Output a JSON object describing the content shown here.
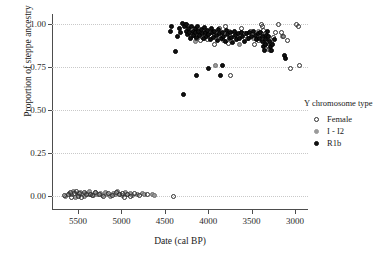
{
  "chart_data": {
    "type": "scatter",
    "title": "",
    "xlabel": "Date (cal BP)",
    "ylabel": "Proportion of steppe ancestry",
    "xlim": [
      5800,
      2850
    ],
    "ylim": [
      -0.08,
      1.06
    ],
    "x_reversed": true,
    "xticks": [
      5500,
      5000,
      4500,
      4000,
      3500,
      3000
    ],
    "yticks": [
      0.0,
      0.25,
      0.5,
      0.75,
      1.0
    ],
    "ytick_labels": [
      "0.00",
      "0.25",
      "0.50",
      "0.75",
      "1.00"
    ],
    "xtick_labels": [
      "5500",
      "5000",
      "4500",
      "4000",
      "3500",
      "3000"
    ],
    "grid": "horizontal-dotted",
    "legend": {
      "title": "Y chromosome type",
      "position": "right",
      "entries": [
        {
          "name": "Female",
          "marker": "open-circle",
          "color": "#2e2e2e",
          "fill": "none"
        },
        {
          "name": "I - I2",
          "marker": "filled-circle",
          "color": "#9a9a9a",
          "fill": "#9a9a9a"
        },
        {
          "name": "R1b",
          "marker": "filled-circle",
          "color": "#111111",
          "fill": "#111111"
        }
      ]
    },
    "series": [
      {
        "name": "Female",
        "points": [
          [
            5660,
            0.005
          ],
          [
            5610,
            0.01
          ],
          [
            5585,
            0.02
          ],
          [
            5570,
            -0.005
          ],
          [
            5545,
            0.015
          ],
          [
            5520,
            0.025
          ],
          [
            5500,
            0.0
          ],
          [
            5478,
            0.018
          ],
          [
            5455,
            -0.01
          ],
          [
            5430,
            0.022
          ],
          [
            5400,
            0.008
          ],
          [
            5360,
            0.012
          ],
          [
            5330,
            0.002
          ],
          [
            5300,
            0.02
          ],
          [
            5255,
            0.01
          ],
          [
            5210,
            0.0
          ],
          [
            5150,
            0.015
          ],
          [
            5105,
            0.005
          ],
          [
            5060,
            0.022
          ],
          [
            5020,
            0.008
          ],
          [
            4990,
            0.018
          ],
          [
            4960,
            -0.005
          ],
          [
            4930,
            0.012
          ],
          [
            4900,
            0.0
          ],
          [
            4850,
            0.015
          ],
          [
            4790,
            0.005
          ],
          [
            4700,
            0.01
          ],
          [
            4400,
            0.0
          ],
          [
            4260,
            1.0
          ],
          [
            4230,
            0.985
          ],
          [
            4215,
            0.955
          ],
          [
            4195,
            0.93
          ],
          [
            4180,
            0.975
          ],
          [
            4160,
            0.945
          ],
          [
            4140,
            0.92
          ],
          [
            4120,
            0.96
          ],
          [
            4105,
            0.935
          ],
          [
            4085,
            0.905
          ],
          [
            4060,
            0.965
          ],
          [
            4035,
            0.94
          ],
          [
            4010,
            0.91
          ],
          [
            3985,
            0.955
          ],
          [
            3960,
            0.93
          ],
          [
            3930,
            0.88
          ],
          [
            3900,
            0.945
          ],
          [
            3870,
            0.975
          ],
          [
            3840,
            0.915
          ],
          [
            3800,
            0.985
          ],
          [
            3770,
            0.89
          ],
          [
            3740,
            0.7
          ],
          [
            3700,
            0.955
          ],
          [
            3660,
            0.925
          ],
          [
            3620,
            0.975
          ],
          [
            3580,
            0.945
          ],
          [
            3545,
            0.915
          ],
          [
            3510,
            0.96
          ],
          [
            3470,
            0.88
          ],
          [
            3440,
            0.935
          ],
          [
            3415,
            0.905
          ],
          [
            3390,
            1.0
          ],
          [
            3375,
            0.985
          ],
          [
            3360,
            0.965
          ],
          [
            3345,
            0.945
          ],
          [
            3330,
            0.925
          ],
          [
            3315,
            0.9
          ],
          [
            3300,
            0.87
          ],
          [
            3285,
            0.845
          ],
          [
            3270,
            0.89
          ],
          [
            3250,
            0.925
          ],
          [
            3230,
            0.955
          ],
          [
            3190,
            1.0
          ],
          [
            3160,
            0.955
          ],
          [
            3130,
            0.93
          ],
          [
            3090,
            0.905
          ],
          [
            3050,
            0.745
          ],
          [
            2980,
            1.0
          ],
          [
            2960,
            0.985
          ],
          [
            2950,
            0.76
          ]
        ]
      },
      {
        "name": "I - I2",
        "points": [
          [
            5640,
            0.0
          ],
          [
            5600,
            0.018
          ],
          [
            5575,
            0.008
          ],
          [
            5550,
            0.025
          ],
          [
            5530,
            -0.008
          ],
          [
            5510,
            0.015
          ],
          [
            5490,
            0.005
          ],
          [
            5470,
            0.022
          ],
          [
            5450,
            0.01
          ],
          [
            5425,
            0.0
          ],
          [
            5410,
            0.018
          ],
          [
            5385,
            0.008
          ],
          [
            5365,
            0.025
          ],
          [
            5340,
            0.012
          ],
          [
            5320,
            0.002
          ],
          [
            5295,
            0.02
          ],
          [
            5270,
            0.008
          ],
          [
            5240,
            0.015
          ],
          [
            5215,
            0.005
          ],
          [
            5185,
            0.022
          ],
          [
            5160,
            0.01
          ],
          [
            5130,
            0.0
          ],
          [
            5095,
            0.018
          ],
          [
            5070,
            0.008
          ],
          [
            5040,
            0.025
          ],
          [
            5010,
            0.012
          ],
          [
            4985,
            0.002
          ],
          [
            4955,
            0.02
          ],
          [
            4925,
            0.008
          ],
          [
            4895,
            0.015
          ],
          [
            4870,
            0.005
          ],
          [
            4820,
            0.01
          ],
          [
            4760,
            0.018
          ],
          [
            4730,
            0.008
          ],
          [
            4640,
            0.012
          ],
          [
            4620,
            0.005
          ],
          [
            4240,
            0.96
          ],
          [
            4190,
            0.93
          ],
          [
            4150,
            0.9
          ],
          [
            4100,
            0.945
          ],
          [
            4040,
            0.915
          ],
          [
            3975,
            0.955
          ],
          [
            3920,
            0.76
          ],
          [
            3880,
            0.935
          ],
          [
            3820,
            0.905
          ],
          [
            3760,
            0.96
          ],
          [
            3700,
            0.93
          ],
          [
            3640,
            0.88
          ],
          [
            3560,
            0.945
          ],
          [
            3480,
            0.915
          ],
          [
            3420,
            0.96
          ],
          [
            3355,
            0.935
          ],
          [
            3335,
            0.885
          ],
          [
            3310,
            0.855
          ],
          [
            3290,
            0.905
          ],
          [
            3140,
            0.93
          ]
        ]
      },
      {
        "name": "R1b",
        "points": [
          [
            4300,
            1.005
          ],
          [
            4270,
            0.985
          ],
          [
            4255,
            0.96
          ],
          [
            4245,
            1.0
          ],
          [
            4235,
            0.94
          ],
          [
            4222,
            0.975
          ],
          [
            4210,
            0.95
          ],
          [
            4200,
            0.92
          ],
          [
            4188,
            0.985
          ],
          [
            4175,
            0.96
          ],
          [
            4165,
            0.935
          ],
          [
            4152,
            0.975
          ],
          [
            4142,
            0.95
          ],
          [
            4130,
            0.925
          ],
          [
            4118,
            0.99
          ],
          [
            4108,
            0.96
          ],
          [
            4096,
            0.935
          ],
          [
            4082,
            0.97
          ],
          [
            4070,
            0.945
          ],
          [
            4058,
            0.915
          ],
          [
            4045,
            0.98
          ],
          [
            4030,
            0.955
          ],
          [
            4018,
            0.93
          ],
          [
            4005,
            0.965
          ],
          [
            3992,
            0.94
          ],
          [
            3978,
            0.91
          ],
          [
            3965,
            0.975
          ],
          [
            3950,
            0.95
          ],
          [
            3938,
            0.925
          ],
          [
            3925,
            0.96
          ],
          [
            3910,
            0.935
          ],
          [
            3895,
            0.905
          ],
          [
            3880,
            0.97
          ],
          [
            3865,
            0.945
          ],
          [
            3850,
            0.92
          ],
          [
            3835,
            0.955
          ],
          [
            3820,
            0.93
          ],
          [
            3805,
            0.9
          ],
          [
            3790,
            0.965
          ],
          [
            3775,
            0.94
          ],
          [
            3760,
            0.915
          ],
          [
            3745,
            0.95
          ],
          [
            3730,
            0.925
          ],
          [
            3715,
            0.895
          ],
          [
            3700,
            0.96
          ],
          [
            3685,
            0.935
          ],
          [
            3670,
            0.91
          ],
          [
            3655,
            0.945
          ],
          [
            3640,
            0.92
          ],
          [
            3620,
            0.955
          ],
          [
            3600,
            0.93
          ],
          [
            3580,
            0.9
          ],
          [
            3560,
            0.945
          ],
          [
            3540,
            0.92
          ],
          [
            3520,
            0.955
          ],
          [
            3500,
            0.93
          ],
          [
            3480,
            0.96
          ],
          [
            3460,
            0.935
          ],
          [
            3440,
            0.91
          ],
          [
            3420,
            0.945
          ],
          [
            3405,
            0.92
          ],
          [
            3392,
            0.955
          ],
          [
            3380,
            0.93
          ],
          [
            3370,
            0.9
          ],
          [
            3362,
            0.87
          ],
          [
            3352,
            0.845
          ],
          [
            3344,
            0.88
          ],
          [
            3336,
            0.91
          ],
          [
            3328,
            0.935
          ],
          [
            3320,
            0.96
          ],
          [
            3308,
            0.93
          ],
          [
            3296,
            0.9
          ],
          [
            3284,
            0.87
          ],
          [
            3270,
            0.845
          ],
          [
            3255,
            0.88
          ],
          [
            3240,
            0.91
          ],
          [
            3120,
            0.82
          ],
          [
            3105,
            0.8
          ],
          [
            4380,
            0.84
          ],
          [
            4290,
            0.59
          ],
          [
            4420,
            0.985
          ],
          [
            4440,
            0.96
          ],
          [
            4350,
            0.93
          ],
          [
            4330,
            0.975
          ],
          [
            4315,
            0.95
          ],
          [
            3860,
            0.7
          ],
          [
            3830,
            0.76
          ],
          [
            4135,
            0.7
          ],
          [
            4000,
            0.745
          ]
        ]
      }
    ]
  }
}
